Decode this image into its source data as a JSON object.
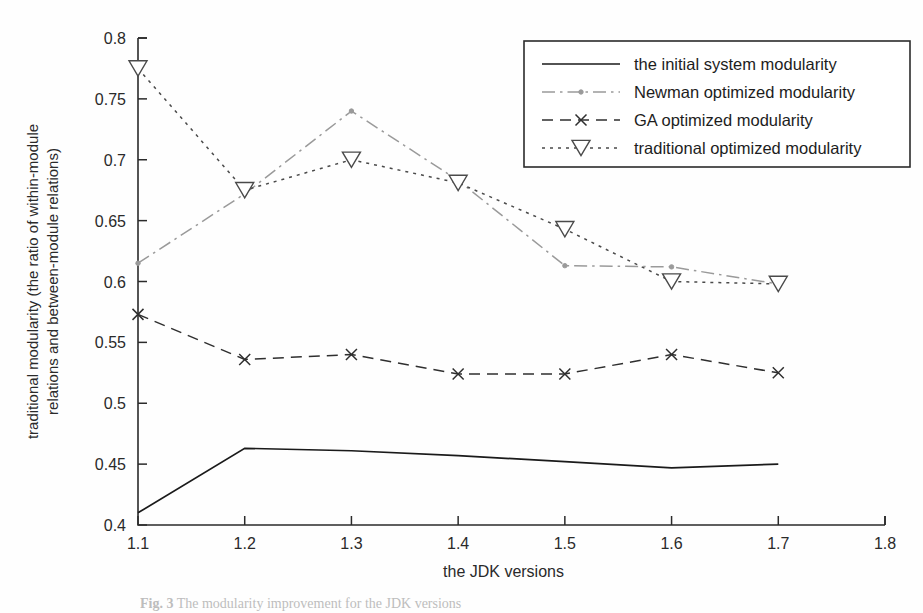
{
  "figure": {
    "caption_prefix": "Fig. 3",
    "caption_text": "The modularity improvement for the JDK versions"
  },
  "chart_data": {
    "type": "line",
    "title": "",
    "xlabel": "the JDK versions",
    "ylabel": "traditional modularity (the ratio of within-module relations and between-module relations)",
    "ylabel_line1": "traditional modularity (the ratio of within-module",
    "ylabel_line2": "relations and between-module relations)",
    "x": [
      1.1,
      1.2,
      1.3,
      1.4,
      1.5,
      1.6,
      1.7
    ],
    "xlim": [
      1.1,
      1.8
    ],
    "ylim": [
      0.4,
      0.8
    ],
    "xticks": [
      "1.1",
      "1.2",
      "1.3",
      "1.4",
      "1.5",
      "1.6",
      "1.7",
      "1.8"
    ],
    "xtick_values": [
      1.1,
      1.2,
      1.3,
      1.4,
      1.5,
      1.6,
      1.7,
      1.8
    ],
    "yticks": [
      "0.4",
      "0.45",
      "0.5",
      "0.55",
      "0.6",
      "0.65",
      "0.7",
      "0.75",
      "0.8"
    ],
    "ytick_values": [
      0.4,
      0.45,
      0.5,
      0.55,
      0.6,
      0.65,
      0.7,
      0.75,
      0.8
    ],
    "grid": false,
    "legend_position": "upper right",
    "series": [
      {
        "name": "the initial system modularity",
        "values": [
          0.41,
          0.463,
          0.461,
          0.457,
          0.452,
          0.447,
          0.45
        ],
        "style": "solid",
        "marker": "none",
        "color": "#1a1a1a"
      },
      {
        "name": "Newman optimized modularity",
        "values": [
          0.615,
          0.672,
          0.74,
          0.683,
          0.613,
          0.612,
          0.598
        ],
        "style": "dashdot",
        "marker": "dot",
        "color": "#9a9a9a"
      },
      {
        "name": "GA optimized modularity",
        "values": [
          0.573,
          0.536,
          0.54,
          0.524,
          0.524,
          0.54,
          0.525
        ],
        "style": "dashed",
        "marker": "x",
        "color": "#2f2f2f"
      },
      {
        "name": "traditional optimized modularity",
        "values": [
          0.775,
          0.675,
          0.7,
          0.681,
          0.643,
          0.6,
          0.598
        ],
        "style": "dotted",
        "marker": "triangle-down",
        "color": "#4a4a4a"
      }
    ]
  }
}
